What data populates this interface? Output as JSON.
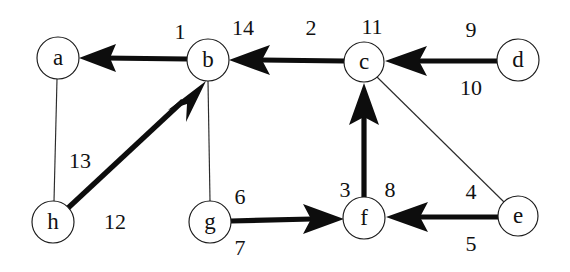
{
  "diagram": {
    "background_color": "#ffffff",
    "stroke_color": "#0d0d0d",
    "width": 570,
    "height": 272
  },
  "nodes": [
    {
      "id": "a",
      "label": "a",
      "cx": 58,
      "cy": 58,
      "r": 21
    },
    {
      "id": "b",
      "label": "b",
      "cx": 208,
      "cy": 60,
      "r": 21
    },
    {
      "id": "c",
      "label": "c",
      "cx": 364,
      "cy": 62,
      "r": 20
    },
    {
      "id": "d",
      "label": "d",
      "cx": 518,
      "cy": 60,
      "r": 21
    },
    {
      "id": "e",
      "label": "e",
      "cx": 518,
      "cy": 216,
      "r": 20
    },
    {
      "id": "f",
      "label": "f",
      "cx": 364,
      "cy": 218,
      "r": 21
    },
    {
      "id": "g",
      "label": "g",
      "cx": 210,
      "cy": 222,
      "r": 21
    },
    {
      "id": "h",
      "label": "h",
      "cx": 53,
      "cy": 222,
      "r": 21
    }
  ],
  "edges": [
    {
      "id": "b-a",
      "from": "b",
      "to": "a",
      "style": "thick",
      "directed": true,
      "labels": [
        "1"
      ]
    },
    {
      "id": "c-b",
      "from": "c",
      "to": "b",
      "style": "thick",
      "directed": true,
      "labels": [
        "14",
        "2"
      ]
    },
    {
      "id": "d-c",
      "from": "d",
      "to": "c",
      "style": "thick",
      "directed": true,
      "labels": [
        "9",
        "10"
      ]
    },
    {
      "id": "f-c",
      "from": "f",
      "to": "c",
      "style": "thick",
      "directed": true,
      "labels": [
        "3",
        "8"
      ]
    },
    {
      "id": "h-b",
      "from": "h",
      "to": "b",
      "style": "thick",
      "directed": true,
      "labels": [
        "12"
      ]
    },
    {
      "id": "g-f",
      "from": "g",
      "to": "f",
      "style": "thick",
      "directed": true,
      "labels": [
        "6",
        "7"
      ]
    },
    {
      "id": "e-f",
      "from": "e",
      "to": "f",
      "style": "thick",
      "directed": true,
      "labels": [
        "4",
        "5"
      ]
    },
    {
      "id": "a-h",
      "from": "a",
      "to": "h",
      "style": "thin",
      "directed": false,
      "labels": [
        "13"
      ]
    },
    {
      "id": "b-g",
      "from": "b",
      "to": "g",
      "style": "thin",
      "directed": false,
      "labels": []
    },
    {
      "id": "c-e",
      "from": "c",
      "to": "e",
      "style": "thin",
      "directed": false,
      "labels": [
        "4"
      ]
    }
  ],
  "weight_labels": [
    {
      "id": "w-1",
      "text": "1",
      "x": 180,
      "y": 34,
      "edge": "b-a"
    },
    {
      "id": "w-14",
      "text": "14",
      "x": 243,
      "y": 30,
      "edge": "c-b"
    },
    {
      "id": "w-2",
      "text": "2",
      "x": 311,
      "y": 30,
      "edge": "c-b"
    },
    {
      "id": "w-11",
      "text": "11",
      "x": 372,
      "y": 29,
      "edge": "c-b"
    },
    {
      "id": "w-9",
      "text": "9",
      "x": 471,
      "y": 32,
      "edge": "d-c"
    },
    {
      "id": "w-10",
      "text": "10",
      "x": 471,
      "y": 90,
      "edge": "d-c"
    },
    {
      "id": "w-13",
      "text": "13",
      "x": 80,
      "y": 163,
      "edge": "a-h"
    },
    {
      "id": "w-12",
      "text": "12",
      "x": 115,
      "y": 224,
      "edge": "h-b"
    },
    {
      "id": "w-6",
      "text": "6",
      "x": 240,
      "y": 199,
      "edge": "g-f"
    },
    {
      "id": "w-7",
      "text": "7",
      "x": 240,
      "y": 250,
      "edge": "g-f"
    },
    {
      "id": "w-3",
      "text": "3",
      "x": 345,
      "y": 192,
      "edge": "f-c"
    },
    {
      "id": "w-8",
      "text": "8",
      "x": 390,
      "y": 192,
      "edge": "f-c"
    },
    {
      "id": "w-4-ef",
      "text": "4",
      "x": 471,
      "y": 194,
      "edge": "e-f"
    },
    {
      "id": "w-5",
      "text": "5",
      "x": 471,
      "y": 246,
      "edge": "e-f"
    }
  ]
}
